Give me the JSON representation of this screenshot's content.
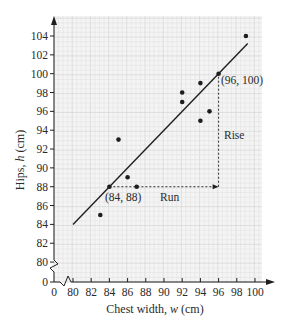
{
  "chart_data": {
    "type": "scatter",
    "title": "",
    "xlabel": "Chest width, w (cm)",
    "ylabel": "Hips, h (cm)",
    "x_ticks": [
      0,
      80,
      82,
      84,
      86,
      88,
      90,
      92,
      94,
      96,
      98,
      100
    ],
    "y_ticks": [
      0,
      80,
      82,
      84,
      86,
      88,
      90,
      92,
      94,
      96,
      98,
      100,
      102,
      104
    ],
    "xlim": [
      80,
      101.5
    ],
    "ylim": [
      79.5,
      105.5
    ],
    "axis_breaks": {
      "x": true,
      "y": true
    },
    "grid": true,
    "legend": null,
    "series": [
      {
        "name": "data points",
        "points": [
          {
            "w": 83,
            "h": 85
          },
          {
            "w": 84,
            "h": 88
          },
          {
            "w": 85,
            "h": 93
          },
          {
            "w": 86,
            "h": 89
          },
          {
            "w": 87,
            "h": 88
          },
          {
            "w": 92,
            "h": 98
          },
          {
            "w": 92,
            "h": 97
          },
          {
            "w": 94,
            "h": 99
          },
          {
            "w": 94,
            "h": 95
          },
          {
            "w": 95,
            "h": 96
          },
          {
            "w": 96,
            "h": 100
          },
          {
            "w": 99,
            "h": 104
          }
        ]
      },
      {
        "name": "line of best fit",
        "type": "line",
        "equation": "h = w + 4",
        "x": [
          80,
          99.2
        ],
        "y": [
          84,
          103.2
        ]
      }
    ],
    "annotations": [
      {
        "text": "(84, 88)",
        "w": 84,
        "h": 88
      },
      {
        "text": "(96, 100)",
        "w": 96,
        "h": 100
      },
      {
        "text": "Run",
        "from": [
          84,
          88
        ],
        "to": [
          96,
          88
        ]
      },
      {
        "text": "Rise",
        "from": [
          96,
          88
        ],
        "to": [
          96,
          100
        ]
      }
    ]
  },
  "labels": {
    "xlabel": "Chest width, w (cm)",
    "xlabel_prefix": "Chest width, ",
    "xlabel_var": "w",
    "xlabel_unit": " (cm)",
    "ylabel_prefix": "Hips, ",
    "ylabel_var": "h",
    "ylabel_unit": " (cm)",
    "point1": "(84, 88)",
    "point2": "(96, 100)",
    "run": "Run",
    "rise": "Rise"
  },
  "colors": {
    "background": "#f4f4f4",
    "grid_minor": "#e2e2e2",
    "grid_major": "#d0d0d0",
    "ink": "#1e1e1e"
  }
}
